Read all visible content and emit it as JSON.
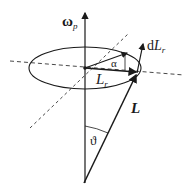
{
  "diagram": {
    "type": "precession-of-angular-momentum",
    "colors": {
      "stroke": "#1a1a1a",
      "background": "#ffffff"
    },
    "labels": {
      "omega_main": "ω",
      "omega_sub": "p",
      "dL_prefix": "d",
      "dL_main": "L",
      "dL_sub": "r",
      "alpha": "α",
      "Lr_main": "L",
      "Lr_sub": "r",
      "L": "L",
      "theta": "ϑ"
    },
    "elements": [
      "vertical axis arrow ω_p",
      "ellipse (precession circle)",
      "dashed horizontal line",
      "dashed diagonal line",
      "vector L from apex to circle",
      "vector L_r in circle plane",
      "rotated vector (alpha angle)",
      "vector dL_r",
      "angle arc ϑ"
    ]
  }
}
